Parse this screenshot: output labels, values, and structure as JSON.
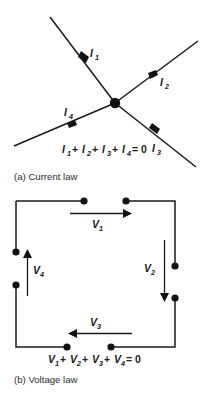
{
  "figure": {
    "background_color": "#ffffff",
    "ink_color": "#1a1a1a",
    "panels": [
      {
        "id": "current-law",
        "caption": "(a) Current law",
        "equation": "I₁ + I₂ + I₃ + I₄ = 0",
        "equation_parts": [
          {
            "symbol": "I",
            "subscript": "1",
            "operator": "+"
          },
          {
            "symbol": "I",
            "subscript": "2",
            "operator": "+"
          },
          {
            "symbol": "I",
            "subscript": "3",
            "operator": "+"
          },
          {
            "symbol": "I",
            "subscript": "4",
            "operator": "= 0"
          }
        ],
        "junction_label": "junction node",
        "branches": [
          {
            "label_symbol": "I",
            "label_subscript": "1",
            "direction": "into-junction-from-upper-left"
          },
          {
            "label_symbol": "I",
            "label_subscript": "2",
            "direction": "out-of-junction-to-upper-right"
          },
          {
            "label_symbol": "I",
            "label_subscript": "3",
            "direction": "out-of-junction-to-lower-right"
          },
          {
            "label_symbol": "I",
            "label_subscript": "4",
            "direction": "into-junction-from-lower-left"
          }
        ]
      },
      {
        "id": "voltage-law",
        "caption": "(b) Voltage law",
        "equation": "V₁ + V₂ + V₃ + V₄ = 0",
        "equation_parts": [
          {
            "symbol": "V",
            "subscript": "1",
            "operator": "+"
          },
          {
            "symbol": "V",
            "subscript": "2",
            "operator": "+"
          },
          {
            "symbol": "V",
            "subscript": "3",
            "operator": "+"
          },
          {
            "symbol": "V",
            "subscript": "4",
            "operator": "= 0"
          }
        ],
        "branches": [
          {
            "label_symbol": "V",
            "label_subscript": "1",
            "direction": "top-rightward"
          },
          {
            "label_symbol": "V",
            "label_subscript": "2",
            "direction": "right-downward"
          },
          {
            "label_symbol": "V",
            "label_subscript": "3",
            "direction": "bottom-leftward"
          },
          {
            "label_symbol": "V",
            "label_subscript": "4",
            "direction": "left-upward"
          }
        ]
      }
    ]
  }
}
